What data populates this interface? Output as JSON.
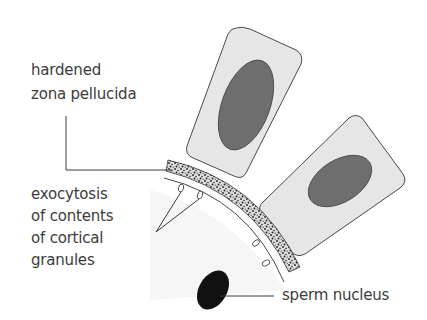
{
  "diagram": {
    "type": "biology-illustration",
    "labels": {
      "zona": {
        "line1": "hardened",
        "line2": "zona pellucida"
      },
      "exocytosis": {
        "line1": "exocytosis",
        "line2": "of contents",
        "line3": "of cortical",
        "line4": "granules"
      },
      "sperm": {
        "text": "sperm nucleus"
      }
    },
    "colors": {
      "text": "#3c3c3c",
      "line": "#3a3a3a",
      "cell_fill": "#e6e6e6",
      "nucleus_fill": "#6e6e6e",
      "sperm_nucleus": "#111111",
      "zona_fill": "#d9d9d9"
    }
  }
}
